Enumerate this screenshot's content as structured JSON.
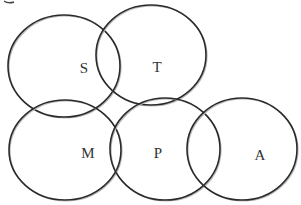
{
  "diagram": {
    "type": "overlapping-circles",
    "stroke_color": "#2a2a2a",
    "background": "#ffffff",
    "circles": [
      {
        "id": "S",
        "label": "S",
        "cx": 64,
        "cy": 66,
        "rx": 56,
        "ry": 51,
        "label_x": 84,
        "label_y": 73
      },
      {
        "id": "T",
        "label": "T",
        "cx": 151,
        "cy": 55,
        "rx": 55,
        "ry": 50,
        "label_x": 157,
        "label_y": 72
      },
      {
        "id": "M",
        "label": "M",
        "cx": 65,
        "cy": 150,
        "rx": 56,
        "ry": 50,
        "label_x": 88,
        "label_y": 158
      },
      {
        "id": "P",
        "label": "P",
        "cx": 165,
        "cy": 149,
        "rx": 55,
        "ry": 51,
        "label_x": 158,
        "label_y": 158
      },
      {
        "id": "A",
        "label": "A",
        "cx": 242,
        "cy": 149,
        "rx": 55,
        "ry": 51,
        "label_x": 260,
        "label_y": 160
      }
    ],
    "overlaps": [
      [
        "S",
        "T"
      ],
      [
        "S",
        "M"
      ],
      [
        "T",
        "P"
      ],
      [
        "M",
        "P"
      ],
      [
        "P",
        "A"
      ]
    ]
  }
}
